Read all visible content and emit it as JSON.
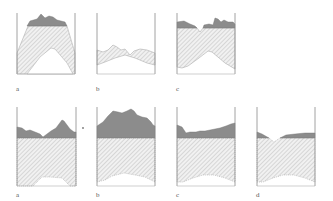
{
  "figure": {
    "rows": [
      {
        "name": "top-row",
        "panels": [
          {
            "label": "a"
          },
          {
            "label": "b"
          },
          {
            "label": "c"
          }
        ]
      },
      {
        "name": "bottom-row",
        "panels": [
          {
            "label": "a"
          },
          {
            "label": "b"
          },
          {
            "label": "c"
          },
          {
            "label": "d"
          }
        ]
      }
    ],
    "colors": {
      "dark_fill": "#8c8c8c",
      "hatch_line": "#b5b5b5",
      "wall": "#8a8a8a",
      "background": "#ffffff"
    }
  }
}
